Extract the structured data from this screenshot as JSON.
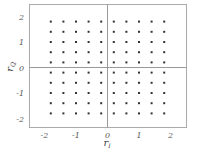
{
  "chart_data": {
    "type": "scatter",
    "title": "",
    "xlabel": "r_I",
    "ylabel": "r_Q",
    "xlim": [
      -2.25,
      2.5
    ],
    "ylim": [
      -2.35,
      2.45
    ],
    "xticks": [
      -2,
      -1,
      0,
      1,
      2
    ],
    "yticks": [
      -2,
      -1,
      0,
      1,
      2
    ],
    "xtick_labels": [
      "-2",
      "-1",
      "0",
      "1",
      "2"
    ],
    "ytick_labels": [
      "-2",
      "-1",
      "0",
      "1",
      "2"
    ],
    "grid": false,
    "zero_lines": true,
    "legend": null,
    "lattice_levels": [
      -1.8,
      -1.4,
      -1.0,
      -0.6,
      -0.2,
      0.2,
      0.6,
      1.0,
      1.4,
      1.8
    ],
    "colors": {
      "points": "#333333",
      "frame": "#aaaaaa",
      "axes": "#999999",
      "text": "#555555"
    }
  }
}
